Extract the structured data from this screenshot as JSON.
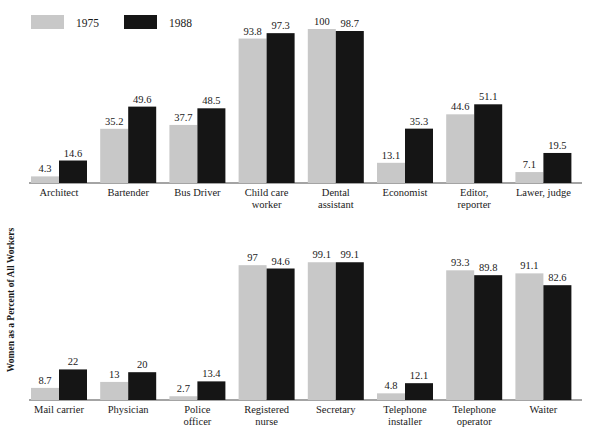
{
  "chart_data": {
    "type": "bar",
    "title": "",
    "subtitle": "",
    "xlabel": "",
    "ylabel": "Women as a Percent of  All Workers",
    "ylim": [
      0,
      100
    ],
    "grid": false,
    "legend_position": "top-left",
    "orientation": "vertical",
    "panels": [
      {
        "name": "top-panel",
        "categories": [
          "Architect",
          "Bartender",
          "Bus Driver",
          "Child care worker",
          "Dental assistant",
          "Economist",
          "Editor, reporter",
          "Lawer, judge"
        ],
        "series": [
          {
            "name": "1975",
            "color": "#c8c8c8",
            "values": [
              4.3,
              35.2,
              37.7,
              93.8,
              100,
              13.1,
              44.6,
              7.1
            ],
            "labels": [
              "4.3",
              "35.2",
              "37.7",
              "93.8",
              "100",
              "13.1",
              "44.6",
              "7.1"
            ]
          },
          {
            "name": "1988",
            "color": "#151515",
            "values": [
              14.6,
              49.6,
              48.5,
              97.3,
              98.7,
              35.3,
              51.1,
              19.5
            ],
            "labels": [
              "14.6",
              "49.6",
              "48.5",
              "97.3",
              "98.7",
              "35.3",
              "51.1",
              "19.5"
            ]
          }
        ]
      },
      {
        "name": "bottom-panel",
        "categories": [
          "Mail carrier",
          "Physician",
          "Police officer",
          "Registered nurse",
          "Secretary",
          "Telephone installer",
          "Telephone operator",
          "Waiter"
        ],
        "series": [
          {
            "name": "1975",
            "color": "#c8c8c8",
            "values": [
              8.7,
              13,
              2.7,
              97,
              99.1,
              4.8,
              93.3,
              91.1
            ],
            "labels": [
              "8.7",
              "13",
              "2.7",
              "97",
              "99.1",
              "4.8",
              "93.3",
              "91.1"
            ]
          },
          {
            "name": "1988",
            "color": "#151515",
            "values": [
              22,
              20,
              13.4,
              94.6,
              99.1,
              12.1,
              89.8,
              82.6
            ],
            "labels": [
              "22",
              "20",
              "13.4",
              "94.6",
              "99.1",
              "12.1",
              "89.8",
              "82.6"
            ]
          }
        ]
      }
    ]
  },
  "legend": {
    "items": [
      {
        "label": "1975",
        "color": "#c8c8c8"
      },
      {
        "label": "1988",
        "color": "#151515"
      }
    ]
  },
  "colors": {
    "series_1975": "#c8c8c8",
    "series_1988": "#151515",
    "axis": "#4a4a4a",
    "text": "#1a1a1a",
    "background": "#ffffff"
  }
}
